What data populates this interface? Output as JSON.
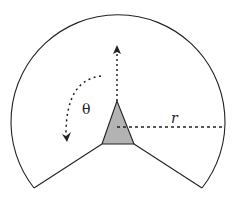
{
  "diagram": {
    "labels": {
      "theta": "θ",
      "radius": "r"
    },
    "colors": {
      "stroke": "#222222",
      "fill_triangle": "#b3b3b3",
      "background": "#ffffff"
    }
  }
}
